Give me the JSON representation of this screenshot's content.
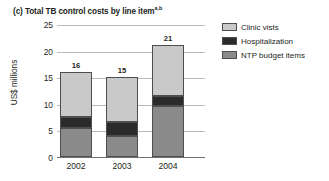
{
  "title": {
    "prefix": "(c)",
    "text": "Total TB control costs by line item",
    "superscript": "a,b",
    "full": "(c) Total TB control costs by line item"
  },
  "axes": {
    "y_title": "US$ millions",
    "y_ticks": [
      "0",
      "5",
      "10",
      "15",
      "20",
      "25"
    ],
    "x_ticks": [
      "2002",
      "2003",
      "2004"
    ]
  },
  "legend": {
    "items": [
      {
        "label": "Clinic vists",
        "color": "#c9c9c9"
      },
      {
        "label": "Hospitalization",
        "color": "#2b2b2b"
      },
      {
        "label": "NTP budget items",
        "color": "#8a8a8a"
      }
    ]
  },
  "bars": [
    {
      "category": "2002",
      "total_label": "16"
    },
    {
      "category": "2003",
      "total_label": "15"
    },
    {
      "category": "2004",
      "total_label": "21"
    }
  ],
  "chart_data": {
    "type": "bar",
    "subtype": "stacked-column",
    "title": "(c) Total TB control costs by line item",
    "title_superscript": "a,b",
    "xlabel": "",
    "ylabel": "US$ millions",
    "categories": [
      "2002",
      "2003",
      "2004"
    ],
    "ylim": [
      0,
      25
    ],
    "yticks": [
      0,
      5,
      10,
      15,
      20,
      25
    ],
    "grid": "horizontal",
    "legend_position": "top-right",
    "series": [
      {
        "name": "NTP budget items",
        "color": "#8a8a8a",
        "values": [
          5.5,
          4.0,
          9.5
        ]
      },
      {
        "name": "Hospitalization",
        "color": "#2b2b2b",
        "values": [
          2.0,
          2.5,
          2.0
        ]
      },
      {
        "name": "Clinic vists",
        "color": "#c9c9c9",
        "values": [
          8.5,
          8.5,
          9.5
        ]
      }
    ],
    "stack_order": [
      "NTP budget items",
      "Hospitalization",
      "Clinic vists"
    ],
    "totals": [
      16,
      15,
      21
    ],
    "data_labels": [
      "16",
      "15",
      "21"
    ]
  }
}
